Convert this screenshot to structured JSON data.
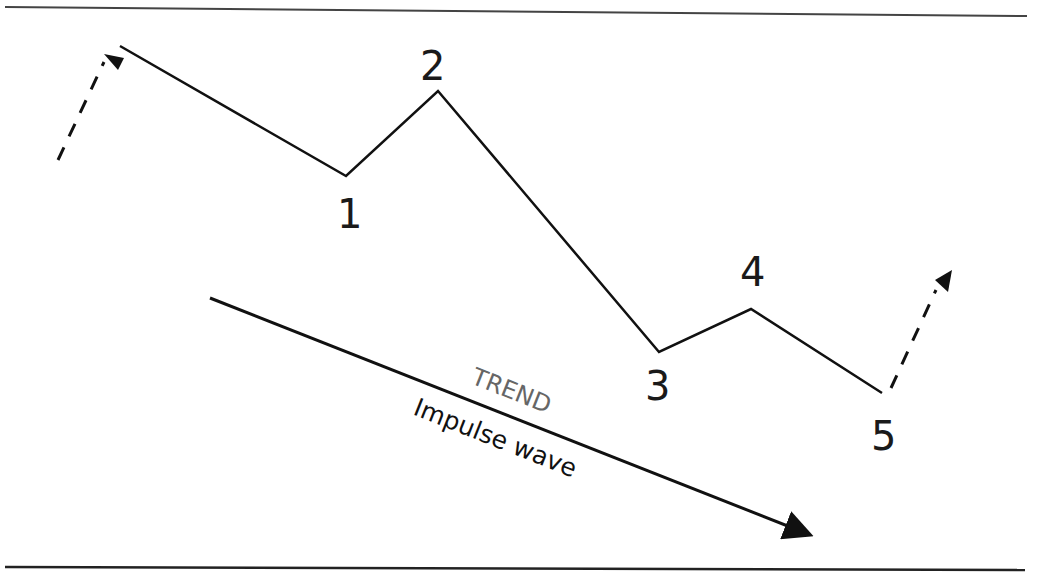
{
  "diagram": {
    "type": "elliott-impulse-wave-downtrend",
    "wave_labels": [
      "1",
      "2",
      "3",
      "4",
      "5"
    ],
    "trend_label": "TREND",
    "wave_type_label": "Impulse wave",
    "colors": {
      "line": "#111111",
      "trend_text": "#666666",
      "background": "#ffffff"
    },
    "wave_points": [
      {
        "label": "start",
        "x": 120,
        "y": 46
      },
      {
        "label": "1",
        "x": 346,
        "y": 176
      },
      {
        "label": "2",
        "x": 438,
        "y": 91
      },
      {
        "label": "3",
        "x": 659,
        "y": 352
      },
      {
        "label": "4",
        "x": 751,
        "y": 309
      },
      {
        "label": "5",
        "x": 882,
        "y": 393
      }
    ]
  }
}
